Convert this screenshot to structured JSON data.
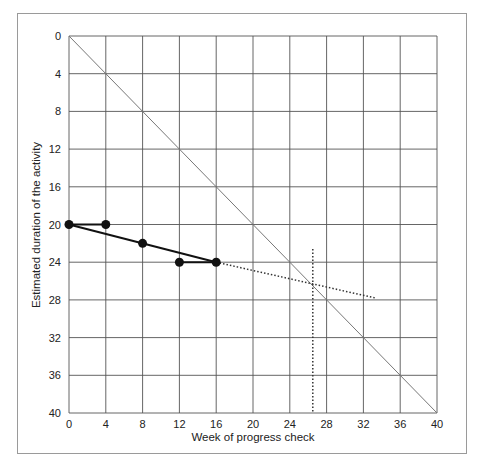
{
  "chart_data": {
    "type": "line",
    "title": "",
    "xlabel": "Week of progress check",
    "ylabel": "Estimated duration of the activity",
    "xlim": [
      0,
      40
    ],
    "ylim": [
      0,
      40
    ],
    "y_inverted": true,
    "grid": true,
    "x_ticks": [
      0,
      4,
      8,
      12,
      16,
      20,
      24,
      28,
      32,
      36,
      40
    ],
    "y_ticks": [
      0,
      4,
      8,
      12,
      16,
      20,
      24,
      28,
      32,
      36,
      40
    ],
    "series": [
      {
        "name": "Diagonal (completion line)",
        "style": "thin-solid",
        "x": [
          0,
          40
        ],
        "y": [
          0,
          40
        ]
      },
      {
        "name": "Estimates at progress checks",
        "style": "solid-markers",
        "x": [
          0,
          4,
          8,
          12,
          16
        ],
        "y": [
          20,
          20,
          22,
          24,
          24
        ]
      },
      {
        "name": "Trend line",
        "style": "solid",
        "x": [
          0,
          16
        ],
        "y": [
          20,
          24
        ]
      },
      {
        "name": "Trend extrapolation",
        "style": "dotted",
        "x": [
          16,
          33.3
        ],
        "y": [
          24,
          27.8
        ]
      },
      {
        "name": "Forecast completion",
        "style": "dotted-vertical",
        "x": [
          26.5,
          26.5
        ],
        "y": [
          22.6,
          40
        ]
      }
    ]
  }
}
